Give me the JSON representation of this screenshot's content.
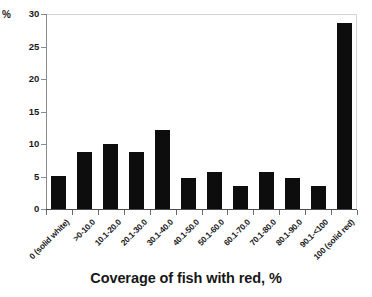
{
  "chart_data": {
    "type": "bar",
    "title": "",
    "xlabel": "Coverage of fish with red, %",
    "ylabel": "%",
    "ylim": [
      0,
      30
    ],
    "yticks": [
      0,
      5,
      10,
      15,
      20,
      25,
      30
    ],
    "ytick_labels": [
      "0",
      "5",
      "10",
      "15",
      "20",
      "25",
      "30"
    ],
    "grid": false,
    "legend": null,
    "bar_color": "#0d0d0d",
    "categories": [
      "0 (solid white)",
      ">0-10.0",
      "10.1-20.0",
      "20.1-30.0",
      "30.1-40.0",
      "40.1-50.0",
      "50.1-60.0",
      "60.1-70.0",
      "70.1-80.0",
      "80.1-90.0",
      "90.1-<100",
      "100 (solid red)"
    ],
    "values": [
      5.1,
      8.7,
      10.0,
      8.8,
      12.2,
      4.7,
      5.7,
      3.6,
      5.7,
      4.7,
      3.6,
      28.6
    ]
  }
}
